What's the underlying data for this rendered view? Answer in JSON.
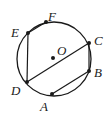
{
  "diagram": {
    "type": "circle-geometry",
    "circle": {
      "center_label": "O",
      "cx": 54,
      "cy": 59,
      "r": 37
    },
    "points": [
      {
        "name": "F",
        "x": 46,
        "y": 22,
        "label_x": 48,
        "label_y": 10
      },
      {
        "name": "E",
        "x": 28,
        "y": 33,
        "label_x": 11,
        "label_y": 26
      },
      {
        "name": "C",
        "x": 89,
        "y": 43,
        "label_x": 94,
        "label_y": 34
      },
      {
        "name": "B",
        "x": 89,
        "y": 71,
        "label_x": 94,
        "label_y": 66
      },
      {
        "name": "A",
        "x": 52,
        "y": 94,
        "label_x": 40,
        "label_y": 100
      },
      {
        "name": "D",
        "x": 27,
        "y": 82,
        "label_x": 11,
        "label_y": 84
      }
    ],
    "center_point": {
      "name": "O",
      "x": 53,
      "y": 58,
      "label_x": 57,
      "label_y": 44
    },
    "chords": [
      [
        "E",
        "F"
      ],
      [
        "E",
        "D"
      ],
      [
        "D",
        "C"
      ],
      [
        "C",
        "B"
      ],
      [
        "B",
        "A"
      ]
    ],
    "colors": {
      "stroke": "#1a1a1a",
      "background": "#ffffff"
    }
  },
  "labels": {
    "F": "F",
    "E": "E",
    "C": "C",
    "B": "B",
    "A": "A",
    "D": "D",
    "O": "O"
  }
}
